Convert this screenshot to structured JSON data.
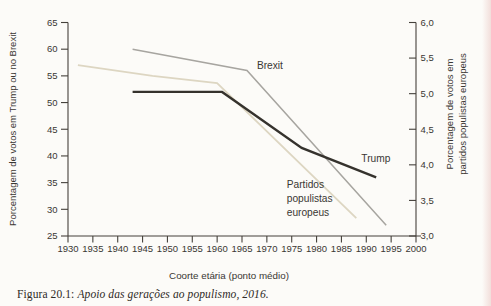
{
  "figure": {
    "caption": {
      "prefix": "Figura 20.1: ",
      "title_italic": "Apoio das gerações ao populismo, 2016."
    }
  },
  "colors": {
    "background": "#fcfbf8",
    "axis": "#45413b",
    "text": "#3a3733",
    "trump_line": "#35322d",
    "brexit_line": "#a7a5a0",
    "populist_line": "#ddd6c2",
    "page_edge": "#e9c6c2"
  },
  "chart_data": {
    "type": "line",
    "title": "",
    "x_axis": {
      "label": "Coorte etária (ponto médio)",
      "min": 1930,
      "max": 2000,
      "ticks": [
        1930,
        1935,
        1940,
        1945,
        1950,
        1955,
        1960,
        1965,
        1970,
        1975,
        1980,
        1985,
        1990,
        1995,
        2000
      ]
    },
    "y_axis_left": {
      "label": "Porcentagem de votos em Trump ou no Brexit",
      "min": 25,
      "max": 65,
      "ticks": [
        25,
        30,
        35,
        40,
        45,
        50,
        55,
        60,
        65
      ]
    },
    "y_axis_right": {
      "label_lines": [
        "Porcentagem de votos em",
        "partidos populistas europeus"
      ],
      "min": 3.0,
      "max": 6.0,
      "ticks": [
        {
          "value": 3.0,
          "label": "3,0"
        },
        {
          "value": 3.5,
          "label": "3,5"
        },
        {
          "value": 4.0,
          "label": "4,0"
        },
        {
          "value": 4.5,
          "label": "4,5"
        },
        {
          "value": 5.0,
          "label": "5,0"
        },
        {
          "value": 5.5,
          "label": "5,5"
        },
        {
          "value": 6.0,
          "label": "6,0"
        }
      ]
    },
    "legend_position": "inline-annotations",
    "grid": false,
    "series": [
      {
        "name": "Partidos populistas europeus",
        "slug": "populist",
        "axis": "right",
        "color_key": "populist_line",
        "stroke_width": 1.8,
        "points": [
          {
            "x": 1932,
            "y": 5.4
          },
          {
            "x": 1947,
            "y": 5.25
          },
          {
            "x": 1960,
            "y": 5.15
          },
          {
            "x": 1988,
            "y": 3.25
          }
        ],
        "annotation": {
          "lines": [
            "Partidos",
            "populistas",
            "europeus"
          ],
          "anchor_x": 1974,
          "anchor_y": 3.73
        }
      },
      {
        "name": "Brexit",
        "slug": "brexit",
        "axis": "left",
        "color_key": "brexit_line",
        "stroke_width": 1.5,
        "points": [
          {
            "x": 1943,
            "y": 60
          },
          {
            "x": 1966,
            "y": 56
          },
          {
            "x": 1994,
            "y": 27
          }
        ],
        "annotation": {
          "lines": [
            "Brexit"
          ],
          "anchor_x": 1968,
          "anchor_y": 57
        }
      },
      {
        "name": "Trump",
        "slug": "trump",
        "axis": "left",
        "color_key": "trump_line",
        "stroke_width": 2.4,
        "points": [
          {
            "x": 1943,
            "y": 52
          },
          {
            "x": 1961,
            "y": 52
          },
          {
            "x": 1977,
            "y": 41.5
          },
          {
            "x": 1992,
            "y": 36
          }
        ],
        "annotation": {
          "lines": [
            "Trump"
          ],
          "anchor_x": 1989,
          "anchor_y": 39.5
        }
      }
    ]
  }
}
